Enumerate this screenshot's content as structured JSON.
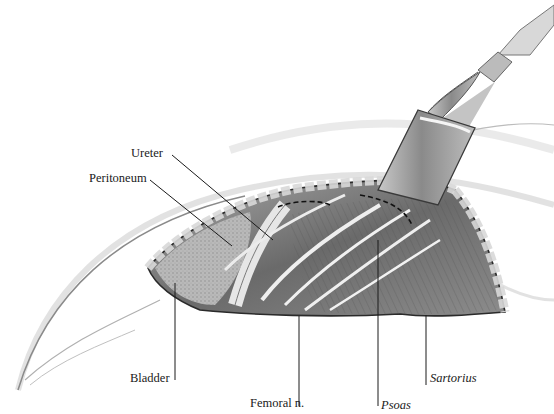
{
  "figure": {
    "type": "anatomical-illustration",
    "colors": {
      "background": "#ffffff",
      "ink": "#1a1a1a",
      "muscle": "#6e6e6e",
      "skin": "#e9e9e9",
      "instrument": "#9a9a9a"
    }
  },
  "labels": [
    {
      "id": "ureter",
      "text": "Ureter",
      "italic": false,
      "x": 131,
      "y": 146,
      "leader": [
        [
          172,
          155
        ],
        [
          273,
          240
        ]
      ]
    },
    {
      "id": "peritoneum",
      "text": "Peritoneum",
      "italic": false,
      "x": 89,
      "y": 171,
      "leader": [
        [
          150,
          180
        ],
        [
          232,
          246
        ]
      ]
    },
    {
      "id": "bladder",
      "text": "Bladder",
      "italic": false,
      "x": 130,
      "y": 371,
      "leader": [
        [
          175,
          283
        ],
        [
          175,
          380
        ]
      ]
    },
    {
      "id": "femoral-n",
      "text": "Femoral n.",
      "italic": false,
      "x": 250,
      "y": 396,
      "leader": [
        [
          299,
          316
        ],
        [
          299,
          406
        ]
      ]
    },
    {
      "id": "psoas",
      "text": "Psoas",
      "italic": true,
      "x": 381,
      "y": 398,
      "leader": [
        [
          378,
          240
        ],
        [
          378,
          406
        ]
      ]
    },
    {
      "id": "sartorius",
      "text": "Sartorius",
      "italic": true,
      "x": 430,
      "y": 371,
      "leader": [
        [
          426,
          315
        ],
        [
          426,
          385
        ]
      ]
    }
  ]
}
